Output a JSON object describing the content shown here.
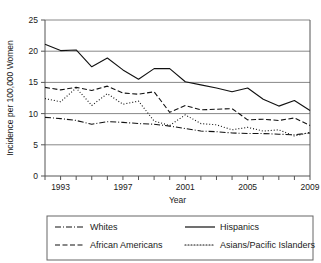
{
  "chart_data": {
    "type": "line",
    "title": "",
    "xlabel": "Year",
    "ylabel": "Incidence per 100,000 Women",
    "xlim": [
      1992,
      2009
    ],
    "ylim": [
      0,
      25
    ],
    "yticks": [
      0,
      5,
      10,
      15,
      20,
      25
    ],
    "ytick_labels": [
      "0",
      "5",
      "10",
      "15",
      "20",
      "25"
    ],
    "xticks": [
      1992,
      1993,
      1994,
      1995,
      1996,
      1997,
      1998,
      1999,
      2000,
      2001,
      2002,
      2003,
      2004,
      2005,
      2006,
      2007,
      2008,
      2009
    ],
    "xtick_labels": [
      "",
      "1993",
      "",
      "",
      "",
      "1997",
      "",
      "",
      "",
      "2001",
      "",
      "",
      "",
      "2005",
      "",
      "",
      "",
      "2009"
    ],
    "grid": "horizontal",
    "legend_position": "bottom",
    "x": [
      1992,
      1993,
      1994,
      1995,
      1996,
      1997,
      1998,
      1999,
      2000,
      2001,
      2002,
      2003,
      2004,
      2005,
      2006,
      2007,
      2008,
      2009
    ],
    "series": [
      {
        "name": "Whites",
        "dash": "dashdot",
        "values": [
          9.4,
          9.2,
          8.9,
          8.3,
          8.7,
          8.6,
          8.4,
          8.3,
          8.0,
          7.6,
          7.2,
          7.1,
          6.9,
          6.8,
          6.8,
          6.7,
          6.6,
          6.9
        ]
      },
      {
        "name": "Hispanics",
        "dash": "solid",
        "values": [
          21.1,
          20.1,
          20.2,
          17.5,
          18.9,
          17.0,
          15.5,
          17.2,
          17.2,
          15.1,
          14.6,
          14.1,
          13.5,
          14.1,
          12.3,
          11.2,
          12.1,
          10.5
        ]
      },
      {
        "name": "African Americans",
        "dash": "dashed",
        "values": [
          14.2,
          13.8,
          14.2,
          13.7,
          14.4,
          13.3,
          13.1,
          13.5,
          10.2,
          11.3,
          10.6,
          10.7,
          10.8,
          9.0,
          9.1,
          8.9,
          9.3,
          8.1
        ]
      },
      {
        "name": "Asians/Pacific Islanders",
        "dash": "dotted",
        "values": [
          12.4,
          11.9,
          14.1,
          11.3,
          13.2,
          11.5,
          12.0,
          8.8,
          8.1,
          9.8,
          8.4,
          8.2,
          7.4,
          7.8,
          7.2,
          7.4,
          6.4,
          7.0
        ]
      }
    ]
  },
  "legend": {
    "entries": [
      {
        "label": "Whites"
      },
      {
        "label": "Hispanics"
      },
      {
        "label": "African Americans"
      },
      {
        "label": "Asians/Pacific Islanders"
      }
    ]
  }
}
